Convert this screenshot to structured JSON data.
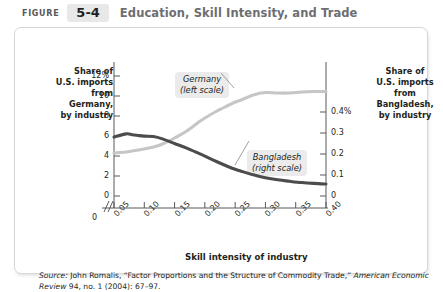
{
  "header": {
    "figure_word": "FIGURE",
    "figure_number": "5-4",
    "title": "Education, Skill Intensity, and Trade"
  },
  "left_axis_title": "Share of\nU.S. imports\nfrom\nGermany,\nby industry",
  "right_axis_title": "Share of\nU.S. imports\nfrom\nBangladesh,\nby industry",
  "callouts": {
    "germany": "Germany\n(left scale)",
    "bangladesh": "Bangladesh\n(right scale)"
  },
  "source": {
    "lead": "Source:",
    "text_part1": " John Romalis, “Factor Proportions and the Structure of Commodity Trade,” ",
    "journal": "American Economic Review",
    "text_part2": " 94, no. 1 (2004): 67–97."
  },
  "colors": {
    "germany_line": "#c6c6c6",
    "bangladesh_line": "#4c4c4c",
    "axis": "#58595b",
    "callout_bg": "#ebebeb",
    "panel_border": "#d7d7d7",
    "chip_bg": "#e8e8e8",
    "title_gray": "#6d6e71"
  },
  "chart_data": {
    "type": "line",
    "title": "Education, Skill Intensity, and Trade",
    "xlabel": "Skill intensity of industry",
    "ylabel": "Share of U.S. imports from Germany, by industry",
    "y2label": "Share of U.S. imports from Bangladesh, by industry",
    "xlim": [
      0.035,
      0.415
    ],
    "ylim": [
      0,
      12
    ],
    "y2lim": [
      0,
      0.4
    ],
    "xticks": [
      "0",
      "0.05",
      "0.10",
      "0.15",
      "0.20",
      "0.25",
      "0.30",
      "0.35",
      "0.40"
    ],
    "xtick_values": [
      0,
      0.05,
      0.1,
      0.15,
      0.2,
      0.25,
      0.3,
      0.35,
      0.4
    ],
    "yticks_left": [
      "12%",
      "10",
      "8",
      "6",
      "4",
      "2",
      "0"
    ],
    "ytick_left_values": [
      12,
      10,
      8,
      6,
      4,
      2,
      0
    ],
    "yticks_right": [
      "0.4%",
      "0.3",
      "0.2",
      "0.1",
      "0"
    ],
    "ytick_right_values": [
      0.4,
      0.3,
      0.2,
      0.1,
      0
    ],
    "axis_break": true,
    "grid": false,
    "legend_position": "inline-callout",
    "x": [
      0.05,
      0.07,
      0.08,
      0.09,
      0.1,
      0.115,
      0.13,
      0.15,
      0.17,
      0.19,
      0.2,
      0.22,
      0.24,
      0.25,
      0.26,
      0.28,
      0.3,
      0.32,
      0.34,
      0.36,
      0.38,
      0.4
    ],
    "series": [
      {
        "name": "Germany (left scale)",
        "axis": "left",
        "units": "percent",
        "color": "#c6c6c6",
        "values": [
          4.3,
          4.4,
          4.5,
          4.6,
          4.7,
          4.9,
          5.2,
          5.8,
          6.5,
          7.4,
          7.8,
          8.5,
          9.1,
          9.4,
          9.6,
          10.1,
          10.35,
          10.3,
          10.3,
          10.4,
          10.45,
          10.45
        ]
      },
      {
        "name": "Bangladesh (right scale)",
        "axis": "right",
        "units": "percent",
        "color": "#4c4c4c",
        "values": [
          0.281,
          0.296,
          0.292,
          0.288,
          0.285,
          0.283,
          0.272,
          0.25,
          0.228,
          0.203,
          0.19,
          0.163,
          0.138,
          0.127,
          0.118,
          0.101,
          0.087,
          0.077,
          0.07,
          0.064,
          0.06,
          0.057
        ]
      }
    ]
  }
}
